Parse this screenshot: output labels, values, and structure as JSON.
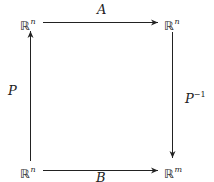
{
  "diagram": {
    "type": "commutative-square",
    "nodes": {
      "top_left": {
        "symbol": "ℝ",
        "exp": "n"
      },
      "top_right": {
        "symbol": "ℝ",
        "exp": "n"
      },
      "bottom_left": {
        "symbol": "ℝ",
        "exp": "n"
      },
      "bottom_right": {
        "symbol": "ℝ",
        "exp": "m"
      }
    },
    "edges": {
      "top": {
        "label": "A",
        "from": "top_left",
        "to": "top_right"
      },
      "bottom": {
        "label": "B",
        "from": "bottom_left",
        "to": "bottom_right"
      },
      "left": {
        "label": "P",
        "from": "bottom_left",
        "to": "top_left"
      },
      "right": {
        "label": "P",
        "label_exp": "−1",
        "from": "top_right",
        "to": "bottom_right"
      }
    },
    "colors": {
      "stroke": "#222222",
      "background": "#ffffff"
    }
  }
}
